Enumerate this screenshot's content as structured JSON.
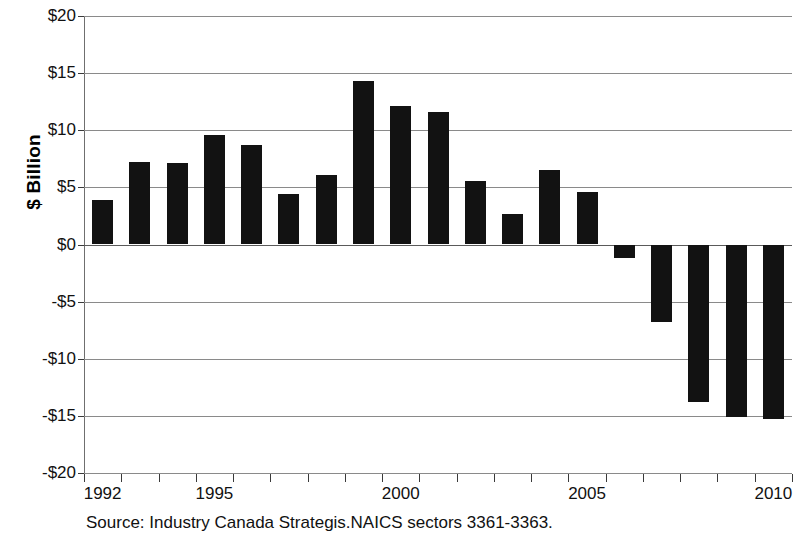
{
  "axis": {
    "y_title": "$ Billion",
    "y_tick_labels": [
      "$20",
      "$15",
      "$10",
      "$5",
      "$0",
      "-$5",
      "-$10",
      "-$15",
      "-$20"
    ],
    "x_tick_labels": [
      "1992",
      "1995",
      "2000",
      "2005",
      "2010"
    ]
  },
  "caption": {
    "source": "Source: Industry Canada Strategis.NAICS sectors 3361-3363."
  },
  "colors": {
    "bar": "#121212",
    "gridline": "#8a8a8a",
    "axis": "#6f6f6f",
    "background": "#ffffff",
    "text": "#111111"
  },
  "chart_data": {
    "type": "bar",
    "title": "",
    "subtitle": "",
    "xlabel": "",
    "ylabel": "$ Billion",
    "categories": [
      "1992",
      "1993",
      "1994",
      "1995",
      "1996",
      "1997",
      "1998",
      "1999",
      "2000",
      "2001",
      "2002",
      "2003",
      "2004",
      "2005",
      "2006",
      "2007",
      "2008",
      "2009",
      "2010"
    ],
    "values": [
      3.9,
      7.2,
      7.1,
      9.6,
      8.7,
      4.4,
      6.1,
      14.3,
      12.1,
      11.6,
      5.6,
      2.7,
      6.5,
      4.6,
      -1.2,
      -6.8,
      -13.8,
      -15.1,
      -15.3
    ],
    "ylim": [
      -20,
      20
    ],
    "ytick_values": [
      20,
      15,
      10,
      5,
      0,
      -5,
      -10,
      -15,
      -20
    ],
    "ytick_labels": [
      "$20",
      "$15",
      "$10",
      "$5",
      "$0",
      "-$5",
      "-$10",
      "-$15",
      "-$20"
    ],
    "xtick_labels": [
      "1992",
      "1995",
      "2000",
      "2005",
      "2010"
    ],
    "labeled_x_categories": [
      "1992",
      "1995",
      "2000",
      "2005",
      "2010"
    ],
    "grid": true,
    "grid_axis": "y",
    "legend": false,
    "legend_position": "none",
    "bar_color": "#121212",
    "annotations": [
      "Source: Industry Canada Strategis.NAICS sectors 3361-3363."
    ]
  }
}
